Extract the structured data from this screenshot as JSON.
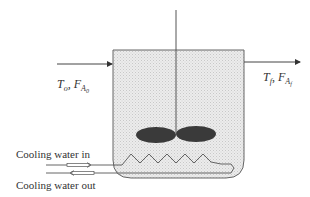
{
  "diagram": {
    "inlet": {
      "label_T": "T",
      "label_T_sub": "o",
      "sep": ",",
      "label_F": "F",
      "label_F_sub": "A",
      "label_F_subsub": "0"
    },
    "outlet": {
      "label_T": "T",
      "label_T_sub": "f",
      "sep": ",",
      "label_F": "F",
      "label_F_sub": "A",
      "label_F_subsub": "f"
    },
    "cooling_in": "Cooling water in",
    "cooling_out": "Cooling water out",
    "colors": {
      "line": "#555555",
      "fill": "#e6e6e6",
      "impeller": "#3a3a3a",
      "text": "#333333"
    }
  }
}
